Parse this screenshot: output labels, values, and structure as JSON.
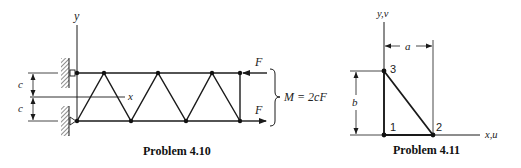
{
  "figures": [
    {
      "id": "problem-4-10",
      "caption": "Problem 4.10",
      "axis_labels": {
        "y": "y",
        "x": "x"
      },
      "dimension_labels": {
        "upper": "c",
        "lower": "c"
      },
      "force_labels": {
        "top": "F",
        "bottom": "F"
      },
      "moment_label": "M = 2cF",
      "truss": {
        "top_nodes_x": [
          77,
          158,
          212,
          240
        ],
        "bottom_nodes_x": [
          77,
          131,
          186,
          240
        ],
        "top_y": 73,
        "bottom_y": 121,
        "mid_y": 97
      }
    },
    {
      "id": "problem-4-11",
      "caption": "Problem 4.11",
      "axis_labels": {
        "y": "y,v",
        "x": "x,u"
      },
      "dimension_labels": {
        "horizontal": "a",
        "vertical": "b"
      },
      "nodes": [
        {
          "label": "1",
          "x": 384,
          "y": 135
        },
        {
          "label": "2",
          "x": 433,
          "y": 135
        },
        {
          "label": "3",
          "x": 384,
          "y": 71
        }
      ]
    }
  ],
  "colors": {
    "ink": "#1a1a1a",
    "background": "#ffffff"
  }
}
